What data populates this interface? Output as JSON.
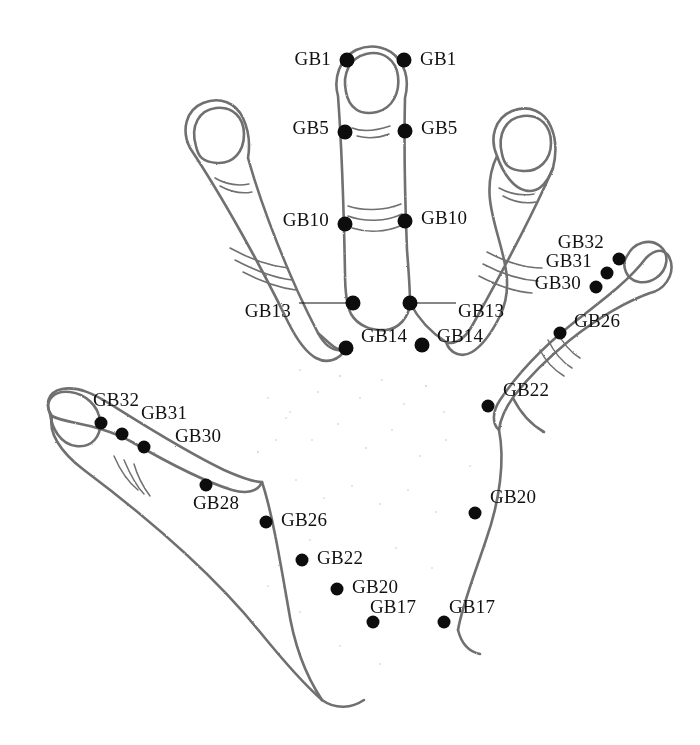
{
  "figure": {
    "background_color": "#ffffff",
    "ink_color": "#6b6b6b",
    "point_color": "#0d0d0d",
    "label_color": "#111111"
  },
  "points": [
    {
      "id": "gb1-left",
      "label": "GB1",
      "x": 347,
      "y": 60,
      "label_x": 331,
      "label_y": 58,
      "side": "r",
      "size": "lg"
    },
    {
      "id": "gb1-right",
      "label": "GB1",
      "x": 404,
      "y": 60,
      "label_x": 420,
      "label_y": 58,
      "side": "l",
      "size": "lg"
    },
    {
      "id": "gb5-left",
      "label": "GB5",
      "x": 345,
      "y": 132,
      "label_x": 329,
      "label_y": 127,
      "side": "r",
      "size": "lg"
    },
    {
      "id": "gb5-right",
      "label": "GB5",
      "x": 405,
      "y": 131,
      "label_x": 421,
      "label_y": 127,
      "side": "l",
      "size": "lg"
    },
    {
      "id": "gb10-left",
      "label": "GB10",
      "x": 345,
      "y": 224,
      "label_x": 329,
      "label_y": 219,
      "side": "r",
      "size": "lg"
    },
    {
      "id": "gb10-right",
      "label": "GB10",
      "x": 405,
      "y": 221,
      "label_x": 421,
      "label_y": 217,
      "side": "l",
      "size": "lg"
    },
    {
      "id": "gb13-left",
      "label": "GB13",
      "x": 353,
      "y": 303,
      "label_x": 291,
      "label_y": 310,
      "side": "r",
      "size": "lg"
    },
    {
      "id": "gb13-right",
      "label": "GB13",
      "x": 410,
      "y": 303,
      "label_x": 458,
      "label_y": 310,
      "side": "l",
      "size": "lg"
    },
    {
      "id": "gb14-left",
      "label": "GB14",
      "x": 346,
      "y": 348,
      "label_x": 361,
      "label_y": 335,
      "side": "l",
      "size": "lg"
    },
    {
      "id": "gb14-right",
      "label": "GB14",
      "x": 422,
      "y": 345,
      "label_x": 437,
      "label_y": 335,
      "side": "l",
      "size": "lg"
    },
    {
      "id": "gb32-right",
      "label": "GB32",
      "x": 619,
      "y": 259,
      "label_x": 604,
      "label_y": 241,
      "side": "r",
      "size": "sm"
    },
    {
      "id": "gb31-right",
      "label": "GB31",
      "x": 607,
      "y": 273,
      "label_x": 592,
      "label_y": 260,
      "side": "r",
      "size": "sm"
    },
    {
      "id": "gb30-right",
      "label": "GB30",
      "x": 596,
      "y": 287,
      "label_x": 581,
      "label_y": 282,
      "side": "r",
      "size": "sm"
    },
    {
      "id": "gb26-right",
      "label": "GB26",
      "x": 560,
      "y": 333,
      "label_x": 574,
      "label_y": 320,
      "side": "l",
      "size": "sm"
    },
    {
      "id": "gb22-right",
      "label": "GB22",
      "x": 488,
      "y": 406,
      "label_x": 503,
      "label_y": 389,
      "side": "l",
      "size": "sm"
    },
    {
      "id": "gb20-right",
      "label": "GB20",
      "x": 475,
      "y": 513,
      "label_x": 490,
      "label_y": 496,
      "side": "l",
      "size": "sm"
    },
    {
      "id": "gb32-left",
      "label": "GB32",
      "x": 101,
      "y": 423,
      "label_x": 116,
      "label_y": 399,
      "side": "c",
      "size": "sm"
    },
    {
      "id": "gb31-left",
      "label": "GB31",
      "x": 122,
      "y": 434,
      "label_x": 164,
      "label_y": 412,
      "side": "c",
      "size": "sm"
    },
    {
      "id": "gb30-left",
      "label": "GB30",
      "x": 144,
      "y": 447,
      "label_x": 198,
      "label_y": 435,
      "side": "c",
      "size": "sm"
    },
    {
      "id": "gb28-left",
      "label": "GB28",
      "x": 206,
      "y": 485,
      "label_x": 216,
      "label_y": 502,
      "side": "c",
      "size": "sm"
    },
    {
      "id": "gb26-left",
      "label": "GB26",
      "x": 266,
      "y": 522,
      "label_x": 281,
      "label_y": 519,
      "side": "l",
      "size": "sm"
    },
    {
      "id": "gb22-left",
      "label": "GB22",
      "x": 302,
      "y": 560,
      "label_x": 317,
      "label_y": 557,
      "side": "l",
      "size": "sm"
    },
    {
      "id": "gb20-left",
      "label": "GB20",
      "x": 337,
      "y": 589,
      "label_x": 352,
      "label_y": 586,
      "side": "l",
      "size": "sm"
    },
    {
      "id": "gb17-left",
      "label": "GB17",
      "x": 373,
      "y": 622,
      "label_x": 393,
      "label_y": 606,
      "side": "c",
      "size": "sm"
    },
    {
      "id": "gb17-right",
      "label": "GB17",
      "x": 444,
      "y": 622,
      "label_x": 472,
      "label_y": 606,
      "side": "c",
      "size": "sm"
    }
  ],
  "leaders": [
    {
      "id": "leader-gb13-left",
      "x": 299,
      "y": 303,
      "width": 54
    },
    {
      "id": "leader-gb13-right",
      "x": 410,
      "y": 303,
      "width": 46
    }
  ]
}
